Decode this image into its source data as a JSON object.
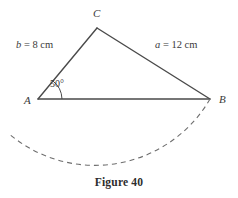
{
  "figure": {
    "caption": "Figure 40",
    "vertices": {
      "A": {
        "label": "A",
        "x": 38,
        "y": 99
      },
      "B": {
        "label": "B",
        "x": 210,
        "y": 99
      },
      "C": {
        "label": "C",
        "x": 97,
        "y": 28
      }
    },
    "side_labels": {
      "b": {
        "variable": "b",
        "equals": " = 8 cm",
        "full": "b = 8 cm",
        "value": 8,
        "unit": "cm"
      },
      "a": {
        "variable": "a",
        "equals": " = 12 cm",
        "full": "a = 12 cm",
        "value": 12,
        "unit": "cm"
      }
    },
    "angle": {
      "at_vertex": "A",
      "label": "50°",
      "value": 50,
      "unit": "degrees"
    },
    "arc": {
      "style": "dashed",
      "center_vertex": "C",
      "radius_label": "a = 12 cm",
      "start": {
        "x": 210,
        "y": 99
      },
      "end": {
        "x": 8,
        "y": 133
      },
      "bottom": {
        "x": 100,
        "y": 166
      }
    },
    "colors": {
      "stroke": "#4a4a4a",
      "arc_stroke": "#6e6e6e",
      "text": "#3a3a3a",
      "caption_text": "#2d2d2d",
      "background": "#ffffff"
    }
  }
}
